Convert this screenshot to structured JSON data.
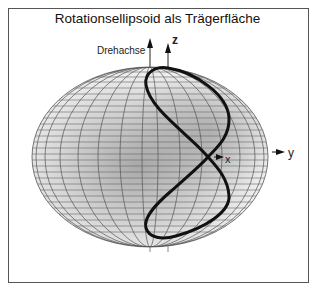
{
  "title": "Rotationsellipsoid als Trägerfläche",
  "labels": {
    "rotation_axis": "Drehachse",
    "z_axis": "z",
    "x_axis": "x",
    "y_axis": "y"
  },
  "colors": {
    "curve": "#111111",
    "grid": "#555555",
    "surface_light": "#f4f4f4",
    "surface_dark": "#b8b8b8",
    "frame": "#555555"
  },
  "ellipsoid": {
    "cx": 150,
    "cy": 157,
    "rx": 118,
    "ry": 90
  },
  "curve": {
    "type": "figure-eight",
    "crossing_point": [
      208,
      157
    ]
  }
}
